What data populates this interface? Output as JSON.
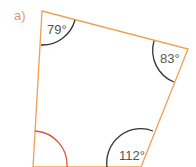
{
  "part_label": "a)",
  "shape": "quadrilateral",
  "colors": {
    "edge": "#f0a050",
    "arc": "#333333",
    "unknown_arc": "#e05040",
    "label": "#e8956a",
    "text": "#555555"
  },
  "angles": [
    {
      "vertex": "top-left",
      "label": "79°"
    },
    {
      "vertex": "right",
      "label": "83°"
    },
    {
      "vertex": "bottom-right",
      "label": "112°"
    },
    {
      "vertex": "bottom-left",
      "label": ""
    }
  ]
}
